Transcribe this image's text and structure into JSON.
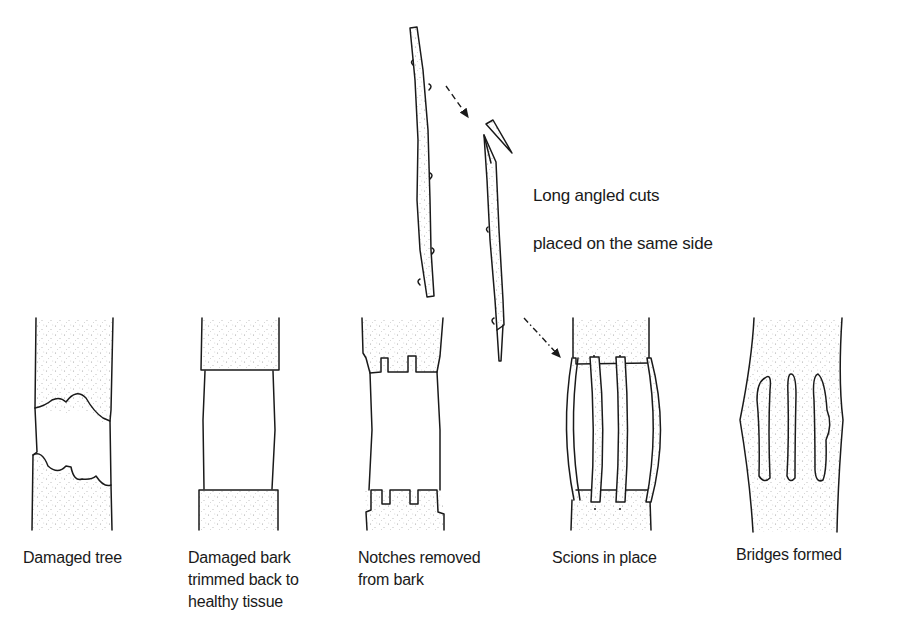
{
  "figure": {
    "top_annotation": {
      "line1": "Long angled cuts",
      "line2": "placed on the same side"
    },
    "stages": [
      {
        "id": "damaged-tree",
        "caption": "Damaged tree"
      },
      {
        "id": "trimmed",
        "caption": "Damaged bark\ntrimmed back to\nhealthy tissue"
      },
      {
        "id": "notches",
        "caption": "Notches removed\nfrom bark"
      },
      {
        "id": "scions",
        "caption": "Scions in place"
      },
      {
        "id": "bridges",
        "caption": "Bridges formed"
      }
    ],
    "colors": {
      "ink": "#1a1a1a",
      "background": "#ffffff",
      "stipple": "#9a9a9a"
    }
  }
}
